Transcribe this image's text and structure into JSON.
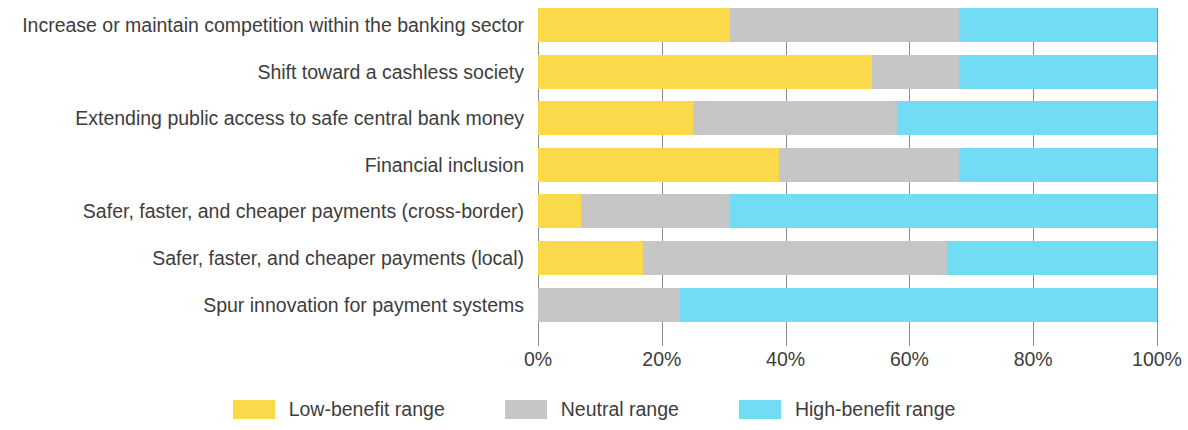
{
  "chart_data": {
    "type": "bar",
    "subtype": "stacked-horizontal-100",
    "title": "",
    "xlabel": "",
    "ylabel": "",
    "xlim": [
      0,
      100
    ],
    "xticks": [
      "0%",
      "20%",
      "40%",
      "60%",
      "80%",
      "100%"
    ],
    "xtick_values": [
      0,
      20,
      40,
      60,
      80,
      100
    ],
    "grid": true,
    "legend_position": "bottom-center",
    "categories": [
      "Increase or maintain competition within the banking sector",
      "Shift toward a cashless society",
      "Extending public access to safe central bank money",
      "Financial inclusion",
      "Safer, faster, and cheaper payments (cross-border)",
      "Safer, faster, and cheaper payments (local)",
      "Spur innovation for payment systems"
    ],
    "series": [
      {
        "name": "Low-benefit range",
        "color": "#fad94b",
        "values": [
          31,
          54,
          25,
          39,
          7,
          17,
          0
        ]
      },
      {
        "name": "Neutral range",
        "color": "#c6c6c6",
        "values": [
          37,
          14,
          33,
          29,
          24,
          49,
          23
        ]
      },
      {
        "name": "High-benefit range",
        "color": "#72dcf4",
        "values": [
          32,
          32,
          42,
          32,
          69,
          34,
          77
        ]
      }
    ]
  },
  "legend": {
    "items": [
      {
        "label": "Low-benefit range",
        "swatch": "low"
      },
      {
        "label": "Neutral range",
        "swatch": "neu"
      },
      {
        "label": "High-benefit range",
        "swatch": "high"
      }
    ]
  },
  "colors": {
    "low_benefit": "#fad94b",
    "neutral": "#c6c6c6",
    "high_benefit": "#72dcf4",
    "axis": "#8c8c8c",
    "text": "#3d3d3d",
    "background": "#ffffff"
  }
}
